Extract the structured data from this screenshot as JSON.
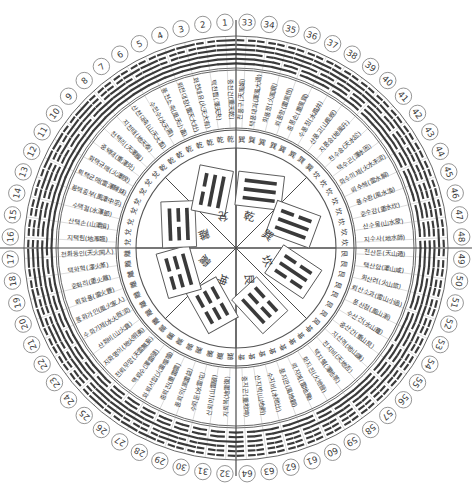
{
  "meta": {
    "canvas_width": 472,
    "canvas_height": 494,
    "center_x": 236,
    "center_y": 248,
    "ink_color": "#3a3a3a",
    "line_color": "#555555",
    "background": "#ffffff"
  },
  "rings": {
    "order": [
      "center-trigram-octants",
      "inner-trigram-character-ring",
      "hexagram-name-ring",
      "hexagram-glyph-ring",
      "number-ring"
    ],
    "radii": {
      "octant_circle": 100,
      "trigram_char_ring_inner": 100,
      "trigram_char_ring_outer": 118,
      "name_ring_inner": 120,
      "name_ring_outer": 178,
      "glyph_ring_inner": 180,
      "glyph_ring_outer": 212,
      "number_ring": 226
    }
  },
  "center": {
    "octants": [
      {
        "index": 0,
        "trigram": "乾",
        "lines": [
          1,
          1,
          1
        ],
        "angle_deg": -67.5
      },
      {
        "index": 1,
        "trigram": "巽",
        "lines": [
          1,
          1,
          0
        ],
        "angle_deg": -22.5
      },
      {
        "index": 2,
        "trigram": "坎",
        "lines": [
          0,
          1,
          0
        ],
        "angle_deg": 22.5
      },
      {
        "index": 3,
        "trigram": "艮",
        "lines": [
          1,
          0,
          0
        ],
        "angle_deg": 67.5
      },
      {
        "index": 4,
        "trigram": "坤",
        "lines": [
          0,
          0,
          0
        ],
        "angle_deg": 112.5
      },
      {
        "index": 5,
        "trigram": "震",
        "lines": [
          0,
          0,
          1
        ],
        "angle_deg": 157.5
      },
      {
        "index": 6,
        "trigram": "離",
        "lines": [
          1,
          0,
          1
        ],
        "angle_deg": 202.5
      },
      {
        "index": 7,
        "trigram": "兌",
        "lines": [
          0,
          1,
          1
        ],
        "angle_deg": 247.5
      }
    ]
  },
  "trigram_char_ring": {
    "note": "64 small trigram characters, one per hexagram sector (upper trigram of each hexagram)",
    "sequence": [
      "乾",
      "乾",
      "乾",
      "乾",
      "乾",
      "乾",
      "乾",
      "乾",
      "兌",
      "兌",
      "兌",
      "兌",
      "兌",
      "兌",
      "兌",
      "兌",
      "離",
      "離",
      "離",
      "離",
      "離",
      "離",
      "離",
      "離",
      "震",
      "震",
      "震",
      "震",
      "震",
      "震",
      "震",
      "震",
      "巽",
      "巽",
      "巽",
      "巽",
      "巽",
      "巽",
      "巽",
      "巽",
      "坎",
      "坎",
      "坎",
      "坎",
      "坎",
      "坎",
      "坎",
      "坎",
      "艮",
      "艮",
      "艮",
      "艮",
      "艮",
      "艮",
      "艮",
      "艮",
      "坤",
      "坤",
      "坤",
      "坤",
      "坤",
      "坤",
      "坤",
      "坤"
    ]
  },
  "hexagrams": [
    {
      "n": 1,
      "name": "중천건(重天乾)",
      "lines": [
        1,
        1,
        1,
        1,
        1,
        1
      ]
    },
    {
      "n": 2,
      "name": "택천쁩(澤天夬)",
      "lines": [
        1,
        1,
        1,
        1,
        1,
        0
      ]
    },
    {
      "n": 3,
      "name": "화천대유(火天大有)",
      "lines": [
        1,
        1,
        1,
        1,
        0,
        1
      ]
    },
    {
      "n": 4,
      "name": "뢰천대장(雷天大壯)",
      "lines": [
        1,
        1,
        1,
        0,
        0,
        1
      ]
    },
    {
      "n": 5,
      "name": "풍천소축(風天小畜)",
      "lines": [
        1,
        1,
        1,
        1,
        1,
        0
      ]
    },
    {
      "n": 6,
      "name": "수천수(水天需)",
      "lines": [
        1,
        1,
        1,
        0,
        1,
        0
      ]
    },
    {
      "n": 7,
      "name": "산천대축(山天大畜)",
      "lines": [
        1,
        1,
        1,
        1,
        0,
        0
      ]
    },
    {
      "n": 8,
      "name": "지천태(地天泰)",
      "lines": [
        1,
        1,
        1,
        0,
        0,
        0
      ]
    },
    {
      "n": 9,
      "name": "천택리(天澤履)",
      "lines": [
        1,
        1,
        0,
        1,
        1,
        1
      ]
    },
    {
      "n": 10,
      "name": "중택태(重澤兑)",
      "lines": [
        1,
        1,
        0,
        1,
        1,
        0
      ]
    },
    {
      "n": 11,
      "name": "화택규매(火澤睽)",
      "lines": [
        1,
        1,
        0,
        1,
        0,
        1
      ]
    },
    {
      "n": 12,
      "name": "뢰택균매(雷澤歸妹)",
      "lines": [
        1,
        1,
        0,
        0,
        0,
        1
      ]
    },
    {
      "n": 13,
      "name": "풍택중부(風澤中孚)",
      "lines": [
        1,
        1,
        0,
        1,
        1,
        0
      ]
    },
    {
      "n": 14,
      "name": "수택절(水澤節)",
      "lines": [
        1,
        1,
        0,
        0,
        1,
        0
      ]
    },
    {
      "n": 15,
      "name": "산택손(山澤損)",
      "lines": [
        1,
        1,
        0,
        1,
        0,
        0
      ]
    },
    {
      "n": 16,
      "name": "지택림(地澤臨)",
      "lines": [
        1,
        1,
        0,
        0,
        0,
        0
      ]
    },
    {
      "n": 17,
      "name": "천화동인(天火同人)",
      "lines": [
        1,
        0,
        1,
        1,
        1,
        1
      ]
    },
    {
      "n": 18,
      "name": "택화혁(澤火革)",
      "lines": [
        1,
        0,
        1,
        1,
        1,
        0
      ]
    },
    {
      "n": 19,
      "name": "중화리(重火離)",
      "lines": [
        1,
        0,
        1,
        1,
        0,
        1
      ]
    },
    {
      "n": 20,
      "name": "뢰화풍(雷火豐)",
      "lines": [
        1,
        0,
        1,
        0,
        0,
        1
      ]
    },
    {
      "n": 21,
      "name": "풍화가인(風火家人)",
      "lines": [
        1,
        0,
        1,
        1,
        1,
        0
      ]
    },
    {
      "n": 22,
      "name": "수화기제(水火既済)",
      "lines": [
        1,
        0,
        1,
        0,
        1,
        0
      ]
    },
    {
      "n": 23,
      "name": "산화비(山火賁)",
      "lines": [
        1,
        0,
        1,
        1,
        0,
        0
      ]
    },
    {
      "n": 24,
      "name": "지화명이(地火明夷)",
      "lines": [
        1,
        0,
        1,
        0,
        0,
        0
      ]
    },
    {
      "n": 25,
      "name": "천뢰무망(天雷無妄)",
      "lines": [
        0,
        0,
        1,
        1,
        1,
        1
      ]
    },
    {
      "n": 26,
      "name": "택뢰수(澤雷隨)",
      "lines": [
        0,
        0,
        1,
        1,
        1,
        0
      ]
    },
    {
      "n": 27,
      "name": "화뢰서합(火雷噬嗑)",
      "lines": [
        0,
        0,
        1,
        1,
        0,
        1
      ]
    },
    {
      "n": 28,
      "name": "중뢰진(重雷震)",
      "lines": [
        0,
        0,
        1,
        0,
        0,
        1
      ]
    },
    {
      "n": 29,
      "name": "풍뢰익(風雷益)",
      "lines": [
        0,
        0,
        1,
        1,
        1,
        0
      ]
    },
    {
      "n": 30,
      "name": "수뢰둔(水雷屯)",
      "lines": [
        0,
        0,
        1,
        0,
        1,
        0
      ]
    },
    {
      "n": 31,
      "name": "산뢰이(山雷頤)",
      "lines": [
        0,
        0,
        1,
        1,
        0,
        0
      ]
    },
    {
      "n": 32,
      "name": "지뢰복(地雷復)",
      "lines": [
        0,
        0,
        1,
        0,
        0,
        0
      ]
    },
    {
      "n": 33,
      "name": "천풍구(天風姤)",
      "lines": [
        1,
        1,
        1,
        1,
        1,
        0
      ]
    },
    {
      "n": 34,
      "name": "택풍대과(澤風大過)",
      "lines": [
        1,
        1,
        0,
        1,
        1,
        0
      ]
    },
    {
      "n": 35,
      "name": "화풍정(火風鼎)",
      "lines": [
        1,
        0,
        1,
        1,
        1,
        0
      ]
    },
    {
      "n": 36,
      "name": "뢰풍항(雷風恆)",
      "lines": [
        0,
        0,
        1,
        1,
        1,
        0
      ]
    },
    {
      "n": 37,
      "name": "중풍손(重風巽)",
      "lines": [
        1,
        1,
        0,
        1,
        1,
        0
      ]
    },
    {
      "n": 38,
      "name": "수풍정(水風井)",
      "lines": [
        0,
        1,
        0,
        1,
        1,
        0
      ]
    },
    {
      "n": 39,
      "name": "산풍고(山風蚬)",
      "lines": [
        1,
        0,
        0,
        1,
        1,
        0
      ]
    },
    {
      "n": 40,
      "name": "지풍승(地風升)",
      "lines": [
        0,
        0,
        0,
        1,
        1,
        0
      ]
    },
    {
      "n": 41,
      "name": "천수송(天水訟)",
      "lines": [
        1,
        1,
        1,
        0,
        1,
        0
      ]
    },
    {
      "n": 42,
      "name": "택수곤(澤水困)",
      "lines": [
        1,
        1,
        0,
        0,
        1,
        0
      ]
    },
    {
      "n": 43,
      "name": "화수미제(火水未済)",
      "lines": [
        1,
        0,
        1,
        0,
        1,
        0
      ]
    },
    {
      "n": 44,
      "name": "뢰수해(雷水解)",
      "lines": [
        0,
        0,
        1,
        0,
        1,
        0
      ]
    },
    {
      "n": 45,
      "name": "풍수환(風水渙)",
      "lines": [
        1,
        1,
        0,
        0,
        1,
        0
      ]
    },
    {
      "n": 46,
      "name": "중수감(重水坎)",
      "lines": [
        0,
        1,
        0,
        0,
        1,
        0
      ]
    },
    {
      "n": 47,
      "name": "산수몽(山水蒙)",
      "lines": [
        1,
        0,
        0,
        0,
        1,
        0
      ]
    },
    {
      "n": 48,
      "name": "지수사(地水師)",
      "lines": [
        0,
        0,
        0,
        0,
        1,
        0
      ]
    },
    {
      "n": 49,
      "name": "천산둔(天山遁)",
      "lines": [
        1,
        1,
        1,
        1,
        0,
        0
      ]
    },
    {
      "n": 50,
      "name": "택산함(澤山咸)",
      "lines": [
        1,
        1,
        0,
        1,
        0,
        0
      ]
    },
    {
      "n": 51,
      "name": "화산려(火山旅)",
      "lines": [
        1,
        0,
        1,
        1,
        0,
        0
      ]
    },
    {
      "n": 52,
      "name": "뢰산소과(雷山小過)",
      "lines": [
        0,
        0,
        1,
        1,
        0,
        0
      ]
    },
    {
      "n": 53,
      "name": "풍산점(風山漸)",
      "lines": [
        1,
        1,
        0,
        1,
        0,
        0
      ]
    },
    {
      "n": 54,
      "name": "수산건(水山蹇)",
      "lines": [
        0,
        1,
        0,
        1,
        0,
        0
      ]
    },
    {
      "n": 55,
      "name": "중산간(重山艮)",
      "lines": [
        1,
        0,
        0,
        1,
        0,
        0
      ]
    },
    {
      "n": 56,
      "name": "지산격(地山謙)",
      "lines": [
        0,
        0,
        0,
        1,
        0,
        0
      ]
    },
    {
      "n": 57,
      "name": "천지비(天地否)",
      "lines": [
        1,
        1,
        1,
        0,
        0,
        0
      ]
    },
    {
      "n": 58,
      "name": "택지췤(澤地萃)",
      "lines": [
        1,
        1,
        0,
        0,
        0,
        0
      ]
    },
    {
      "n": 59,
      "name": "화지진(火地晉)",
      "lines": [
        1,
        0,
        1,
        0,
        0,
        0
      ]
    },
    {
      "n": 60,
      "name": "뢰지예(雷地豫)",
      "lines": [
        0,
        0,
        1,
        0,
        0,
        0
      ]
    },
    {
      "n": 61,
      "name": "풍지관(風地觀)",
      "lines": [
        1,
        1,
        0,
        0,
        0,
        0
      ]
    },
    {
      "n": 62,
      "name": "수지비(水地比)",
      "lines": [
        0,
        1,
        0,
        0,
        0,
        0
      ]
    },
    {
      "n": 63,
      "name": "산지박(山地剥)",
      "lines": [
        1,
        0,
        0,
        0,
        0,
        0
      ]
    },
    {
      "n": 64,
      "name": "중지곤(重地坤)",
      "lines": [
        0,
        0,
        0,
        0,
        0,
        0
      ]
    }
  ],
  "layout": {
    "note": "Numbers 1..32 run counter-clockwise from top, 33..64 run clockwise from top",
    "left_half_start": 1,
    "left_half_end": 32,
    "right_half_start": 33,
    "right_half_end": 64,
    "top_numbers": [
      1,
      33
    ],
    "bottom_numbers": [
      32,
      64
    ],
    "left_numbers": [
      16,
      17
    ],
    "right_numbers": [
      48,
      49
    ]
  }
}
